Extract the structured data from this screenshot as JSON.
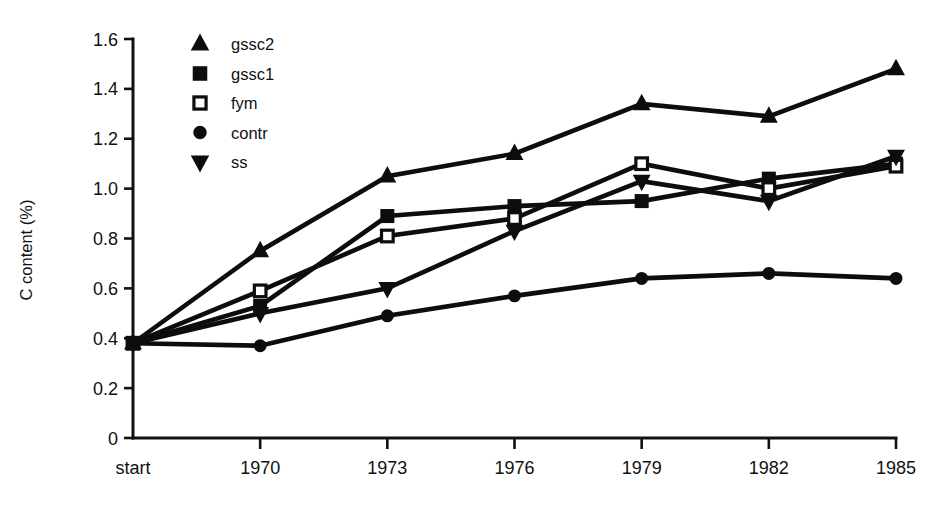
{
  "chart_data": {
    "type": "line",
    "title": "",
    "xlabel": "",
    "ylabel": "C content (%)",
    "categories": [
      "start",
      "1970",
      "1973",
      "1976",
      "1979",
      "1982",
      "1985"
    ],
    "x_tick_labels": [
      "start",
      "1970",
      "1973",
      "1976",
      "1979",
      "1982",
      "1985"
    ],
    "y_tick_labels": [
      "0",
      "0.2",
      "0.4",
      "0.6",
      "0.8",
      "1.0",
      "1.2",
      "1.4",
      "1.6"
    ],
    "y_tick_values": [
      0,
      0.2,
      0.4,
      0.6,
      0.8,
      1.0,
      1.2,
      1.4,
      1.6
    ],
    "ylim": [
      0,
      1.6
    ],
    "grid": false,
    "legend_position": "top-left-inside",
    "series": [
      {
        "name": "gssc2",
        "marker": "triangle-up",
        "marker_fill": "filled",
        "values": [
          0.38,
          0.75,
          1.05,
          1.14,
          1.34,
          1.29,
          1.48
        ]
      },
      {
        "name": "gssc1",
        "marker": "square",
        "marker_fill": "filled",
        "values": [
          0.38,
          0.53,
          0.89,
          0.93,
          0.95,
          1.04,
          1.1
        ]
      },
      {
        "name": "fym",
        "marker": "square",
        "marker_fill": "open",
        "values": [
          0.38,
          0.59,
          0.81,
          0.88,
          1.1,
          1.0,
          1.09
        ]
      },
      {
        "name": "contr",
        "marker": "circle",
        "marker_fill": "filled",
        "values": [
          0.38,
          0.37,
          0.49,
          0.57,
          0.64,
          0.66,
          0.64
        ]
      },
      {
        "name": "ss",
        "marker": "triangle-down",
        "marker_fill": "filled",
        "values": [
          0.38,
          0.5,
          0.6,
          0.83,
          1.03,
          0.95,
          1.13
        ]
      }
    ]
  },
  "legend": {
    "items": [
      {
        "label": "gssc2",
        "marker": "triangle-up-icon"
      },
      {
        "label": "gssc1",
        "marker": "square-filled-icon"
      },
      {
        "label": "fym",
        "marker": "square-open-icon"
      },
      {
        "label": "contr",
        "marker": "circle-filled-icon"
      },
      {
        "label": "ss",
        "marker": "triangle-down-icon"
      }
    ]
  },
  "colors": {
    "ink": "#0d0d0d",
    "background": "#ffffff"
  }
}
